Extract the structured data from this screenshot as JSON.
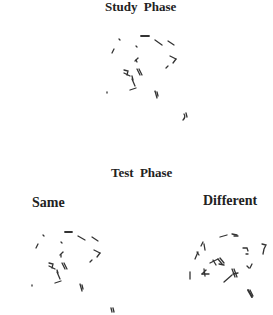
{
  "figure": {
    "study": {
      "title": "Study Phase"
    },
    "test": {
      "title": "Test Phase",
      "conditions": [
        {
          "label": "Same"
        },
        {
          "label": "Different"
        }
      ]
    },
    "stroke_color": "#333333",
    "background": "#ffffff"
  }
}
